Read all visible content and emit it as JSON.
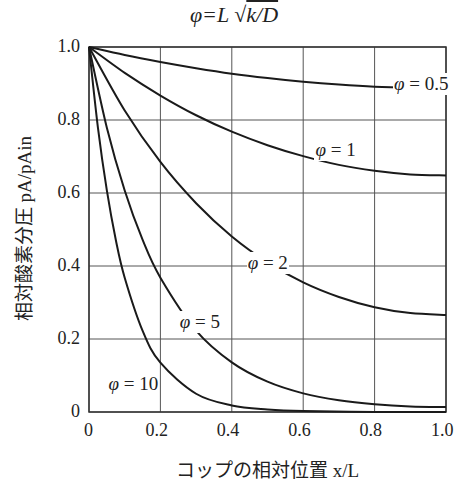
{
  "chart_data": {
    "type": "line",
    "xlabel": "コップの相対位置 x/L",
    "ylabel": "相対酸素分圧 pA/pAin",
    "xlim": [
      0,
      1.0
    ],
    "ylim": [
      0,
      1.0
    ],
    "grid": true,
    "x_ticks": [
      "0",
      "0.2",
      "0.4",
      "0.6",
      "0.8",
      "1.0"
    ],
    "y_ticks": [
      "0",
      "0.2",
      "0.4",
      "0.6",
      "0.8",
      "1.0"
    ],
    "series": [
      {
        "name": "φ=0.5",
        "label_pos": [
          0.93,
          0.895
        ],
        "x": [
          0,
          0.1,
          0.2,
          0.3,
          0.4,
          0.5,
          0.6,
          0.7,
          0.8,
          0.9,
          1.0
        ],
        "values": [
          1,
          0.978,
          0.959,
          0.942,
          0.927,
          0.915,
          0.905,
          0.897,
          0.891,
          0.888,
          0.887
        ]
      },
      {
        "name": "φ=1",
        "label_pos": [
          0.71,
          0.715
        ],
        "x": [
          0,
          0.1,
          0.2,
          0.3,
          0.4,
          0.5,
          0.6,
          0.7,
          0.8,
          0.9,
          1.0
        ],
        "values": [
          1,
          0.929,
          0.867,
          0.813,
          0.768,
          0.731,
          0.701,
          0.677,
          0.661,
          0.651,
          0.648
        ]
      },
      {
        "name": "φ=2",
        "label_pos": [
          0.52,
          0.405
        ],
        "x": [
          0,
          0.1,
          0.2,
          0.3,
          0.4,
          0.5,
          0.6,
          0.7,
          0.8,
          0.9,
          1.0
        ],
        "values": [
          1,
          0.826,
          0.685,
          0.572,
          0.481,
          0.41,
          0.355,
          0.315,
          0.287,
          0.271,
          0.266
        ]
      },
      {
        "name": "φ=5",
        "label_pos": [
          0.33,
          0.245
        ],
        "x": [
          0,
          0.05,
          0.1,
          0.15,
          0.2,
          0.3,
          0.4,
          0.5,
          0.6,
          0.7,
          0.8,
          0.9,
          1.0
        ],
        "values": [
          1,
          0.779,
          0.607,
          0.472,
          0.368,
          0.223,
          0.136,
          0.083,
          0.051,
          0.032,
          0.021,
          0.015,
          0.0135
        ]
      },
      {
        "name": "φ=10",
        "label_pos": [
          0.13,
          0.075
        ],
        "x": [
          0,
          0.025,
          0.05,
          0.075,
          0.1,
          0.15,
          0.2,
          0.3,
          0.4,
          0.5,
          0.6,
          0.8,
          1.0
        ],
        "values": [
          1,
          0.779,
          0.607,
          0.472,
          0.368,
          0.223,
          0.135,
          0.05,
          0.018,
          0.007,
          0.0025,
          0.0003,
          0.0001
        ]
      }
    ]
  },
  "labels": {
    "xlabel": "コップの相対位置 x/L",
    "ylabel": "相対酸素分圧 pA/pAin"
  }
}
